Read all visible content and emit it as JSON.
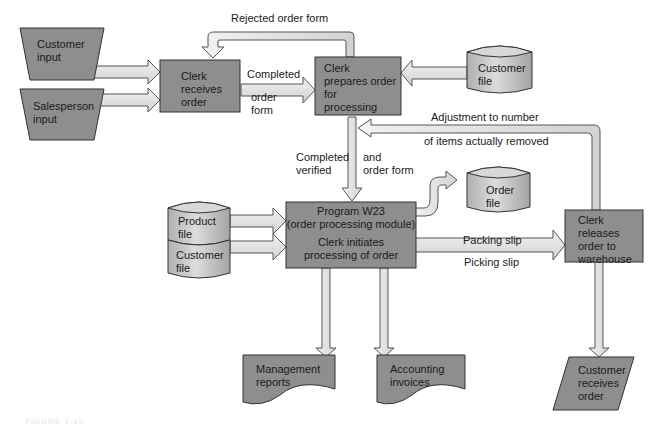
{
  "figure": {
    "caption": "FIGURE 1-10",
    "colors": {
      "box_fill": "#8e8e8e",
      "box_stroke": "#333333",
      "arrow_fill": "#e2e2e2",
      "arrow_stroke": "#555555",
      "cylinder_fill": "#c9c9c9",
      "background": "#ffffff"
    },
    "nodes": {
      "customer_input": {
        "shape": "manual-input-trapezoid",
        "label": "Customer\ninput"
      },
      "salesperson_input": {
        "shape": "manual-input-trapezoid",
        "label": "Salesperson\ninput"
      },
      "clerk_receives": {
        "shape": "process",
        "label": "Clerk\nreceives\norder"
      },
      "clerk_prepares": {
        "shape": "process",
        "label": "Clerk\nprepares order\nfor\nprocessing"
      },
      "customer_file_top": {
        "shape": "cylinder",
        "label": "Customer\nfile"
      },
      "product_file": {
        "shape": "cylinder",
        "label": "Product\nfile"
      },
      "customer_file_bottom": {
        "shape": "cylinder",
        "label": "Customer\nfile"
      },
      "program_w23": {
        "shape": "process",
        "label_title": "Program W23\n(order processing module)",
        "label_sub": "Clerk initiates\nprocessing of order"
      },
      "order_file": {
        "shape": "cylinder",
        "label": "Order\nfile"
      },
      "clerk_releases": {
        "shape": "process",
        "label": "Clerk\nreleases\norder to\nwarehouse"
      },
      "management_reports": {
        "shape": "document",
        "label": "Management\nreports"
      },
      "accounting_invoices": {
        "shape": "document",
        "label": "Accounting\ninvoices"
      },
      "customer_receives": {
        "shape": "parallelogram",
        "label": "Customer\nreceives\norder"
      }
    },
    "edge_labels": {
      "rejected": "Rejected order form",
      "completed": "Completed",
      "order_form": "order\nform",
      "adjustment_top": "Adjustment to number",
      "adjustment_bottom": "of items actually removed",
      "completed_verified": "Completed\nverified",
      "and_order_form": "and\norder form",
      "packing_slip": "Packing slip",
      "picking_slip": "Picking slip"
    }
  }
}
